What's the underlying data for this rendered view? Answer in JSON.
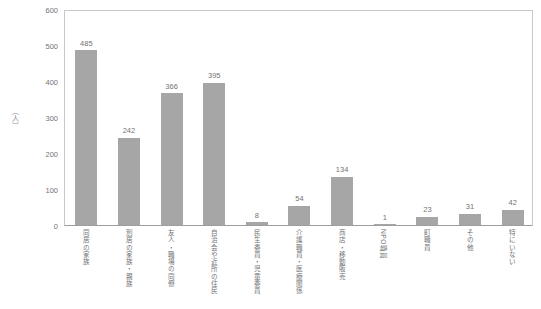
{
  "chart_data": {
    "type": "bar",
    "title": "",
    "xlabel": "",
    "ylabel": "（人）",
    "ylim": [
      0,
      600
    ],
    "yticks": [
      600,
      500,
      400,
      300,
      200,
      100,
      0
    ],
    "grid": false,
    "legend": "none",
    "bar_color": "#a6a6a6",
    "categories": [
      "同居の家族",
      "別居の家族・親族",
      "友人・職場の同僚",
      "自治会や近所の住民",
      "民生委員・児童委員",
      "介護職員・医療関係",
      "商店・移動販売",
      "NPO職員",
      "町職員",
      "その他",
      "特にいない"
    ],
    "values": [
      485,
      242,
      366,
      395,
      8,
      54,
      134,
      1,
      23,
      31,
      42
    ],
    "value_labels": [
      "485",
      "242",
      "366",
      "395",
      "8",
      "54",
      "134",
      "1",
      "23",
      "31",
      "42"
    ]
  }
}
